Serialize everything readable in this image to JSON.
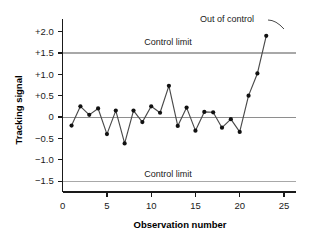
{
  "chart_data": {
    "type": "line",
    "title": "",
    "xlabel": "Observation number",
    "ylabel": "Tracking signal",
    "xlim": [
      0,
      26.5
    ],
    "ylim": [
      -1.75,
      2.25
    ],
    "grid": false,
    "legend": "none",
    "x": [
      1,
      2,
      3,
      4,
      5,
      6,
      7,
      8,
      9,
      10,
      11,
      12,
      13,
      14,
      15,
      16,
      17,
      18,
      19,
      20,
      21,
      22,
      23
    ],
    "values": [
      -0.2,
      0.25,
      0.05,
      0.2,
      -0.4,
      0.15,
      -0.62,
      0.15,
      -0.12,
      0.25,
      0.1,
      0.73,
      -0.21,
      0.22,
      -0.32,
      0.12,
      0.11,
      -0.25,
      -0.05,
      -0.35,
      0.5,
      1.02,
      1.9
    ],
    "series": [
      {
        "name": "Tracking signal",
        "values": [
          -0.2,
          0.25,
          0.05,
          0.2,
          -0.4,
          0.15,
          -0.62,
          0.15,
          -0.12,
          0.25,
          0.1,
          0.73,
          -0.21,
          0.22,
          -0.32,
          0.12,
          0.11,
          -0.25,
          -0.05,
          -0.35,
          0.5,
          1.02,
          1.9
        ]
      }
    ],
    "ytick_labels": [
      "+2.0",
      "+1.5",
      "+1.0",
      "+0.5",
      "0",
      "−0.5",
      "−1.0",
      "−1.5"
    ],
    "ytick_values": [
      2.0,
      1.5,
      1.0,
      0.5,
      0,
      -0.5,
      -1.0,
      -1.5
    ],
    "xtick_labels": [
      "0",
      "5",
      "10",
      "15",
      "20",
      "25"
    ],
    "xtick_values": [
      0,
      5,
      10,
      15,
      20,
      25
    ],
    "reference_lines": [
      {
        "label": "Control limit",
        "value": 1.5
      },
      {
        "label": "Control limit",
        "value": -1.5
      },
      {
        "label": "",
        "value": 0
      }
    ],
    "annotations": [
      {
        "text": "Out of control",
        "target_x": 23,
        "target_y": 1.9
      }
    ],
    "colors": {
      "series": "#4a4a4a",
      "point": "#111111",
      "limit_line": "#a8a8a8",
      "zero_line": "#8e8e8e",
      "axis": "#1a1a1a",
      "background": "#ffffff"
    }
  }
}
